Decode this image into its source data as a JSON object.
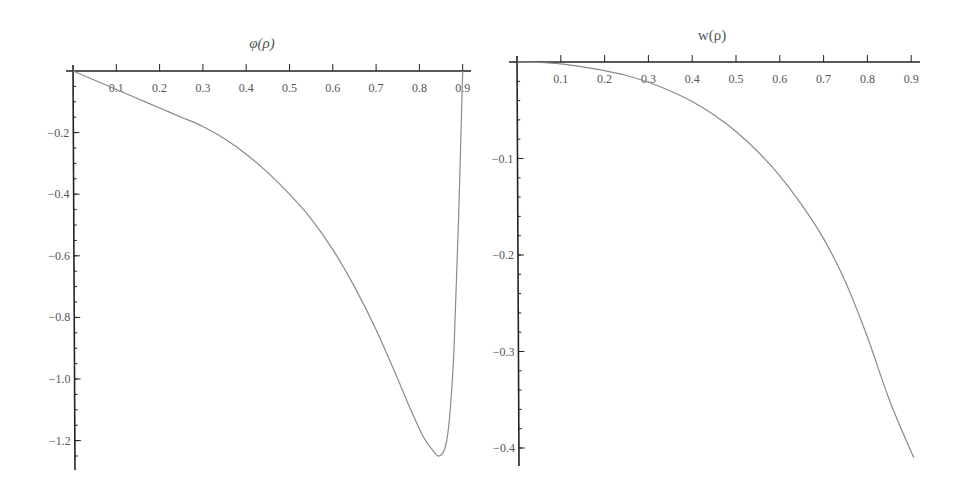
{
  "chart_data": [
    {
      "type": "line",
      "title": "φ(ρ)",
      "xlabel": "",
      "ylabel": "",
      "xlim": [
        0,
        0.91
      ],
      "ylim": [
        -1.29,
        0
      ],
      "grid": false,
      "legend": null,
      "x_ticks": [
        "0.1",
        "0.2",
        "0.3",
        "0.4",
        "0.5",
        "0.6",
        "0.7",
        "0.8",
        "0.9"
      ],
      "y_ticks": [
        "-0.2",
        "-0.4",
        "-0.6",
        "-0.8",
        "-1.0",
        "-1.2"
      ],
      "series": [
        {
          "name": "φ(ρ)",
          "x": [
            0,
            0.05,
            0.1,
            0.15,
            0.2,
            0.25,
            0.3,
            0.35,
            0.4,
            0.45,
            0.5,
            0.55,
            0.6,
            0.65,
            0.7,
            0.75,
            0.78,
            0.81,
            0.83,
            0.845,
            0.86,
            0.87,
            0.88,
            0.89,
            0.9
          ],
          "y": [
            0,
            -0.03,
            -0.06,
            -0.09,
            -0.12,
            -0.15,
            -0.18,
            -0.22,
            -0.27,
            -0.33,
            -0.4,
            -0.48,
            -0.58,
            -0.7,
            -0.84,
            -1.0,
            -1.1,
            -1.19,
            -1.23,
            -1.25,
            -1.22,
            -1.12,
            -0.9,
            -0.5,
            0
          ]
        }
      ]
    },
    {
      "type": "line",
      "title": "w(ρ)",
      "xlabel": "",
      "ylabel": "",
      "xlim": [
        0,
        0.91
      ],
      "ylim": [
        -0.42,
        0
      ],
      "grid": false,
      "legend": null,
      "x_ticks": [
        "0.1",
        "0.2",
        "0.3",
        "0.4",
        "0.5",
        "0.6",
        "0.7",
        "0.8",
        "0.9"
      ],
      "y_ticks": [
        "-0.1",
        "-0.2",
        "-0.3",
        "-0.4"
      ],
      "series": [
        {
          "name": "w(ρ)",
          "x": [
            0,
            0.05,
            0.1,
            0.15,
            0.2,
            0.25,
            0.3,
            0.35,
            0.4,
            0.45,
            0.5,
            0.55,
            0.6,
            0.65,
            0.7,
            0.75,
            0.8,
            0.85,
            0.9,
            0.905
          ],
          "y": [
            0,
            -0.0005,
            -0.002,
            -0.005,
            -0.009,
            -0.014,
            -0.021,
            -0.03,
            -0.041,
            -0.055,
            -0.072,
            -0.093,
            -0.118,
            -0.148,
            -0.183,
            -0.228,
            -0.285,
            -0.35,
            -0.404,
            -0.408
          ]
        }
      ]
    }
  ]
}
